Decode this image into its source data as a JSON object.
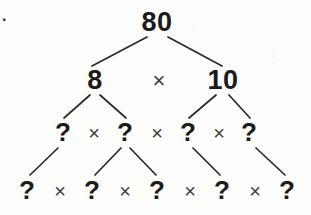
{
  "figure": {
    "kind": "factor-tree",
    "width": 311,
    "height": 215,
    "background_color": "#fdfdfc",
    "ink_color": "#1b1b1b",
    "operator_color": "#3c3c3c"
  },
  "list_marker": {
    "text": "4.",
    "note": "partially cropped at the left edge"
  },
  "rows": {
    "row1": {
      "nodes": [
        {
          "id": "n-80",
          "label": "80",
          "x": 157,
          "y": 22
        }
      ],
      "operators": []
    },
    "row2": {
      "nodes": [
        {
          "id": "n-8",
          "label": "8",
          "x": 95,
          "y": 80
        },
        {
          "id": "n-10",
          "label": "10",
          "x": 223,
          "y": 80
        }
      ],
      "operators": [
        {
          "id": "op-r2-1",
          "label": "×",
          "x": 159,
          "y": 81
        }
      ]
    },
    "row3": {
      "nodes": [
        {
          "id": "n-r3-1",
          "label": "?",
          "x": 63,
          "y": 132
        },
        {
          "id": "n-r3-2",
          "label": "?",
          "x": 125,
          "y": 132
        },
        {
          "id": "n-r3-3",
          "label": "?",
          "x": 188,
          "y": 132
        },
        {
          "id": "n-r3-4",
          "label": "?",
          "x": 249,
          "y": 132
        }
      ],
      "operators": [
        {
          "id": "op-r3-1",
          "label": "×",
          "x": 94,
          "y": 133
        },
        {
          "id": "op-r3-2",
          "label": "×",
          "x": 157,
          "y": 133
        },
        {
          "id": "op-r3-3",
          "label": "×",
          "x": 219,
          "y": 133
        }
      ]
    },
    "row4": {
      "nodes": [
        {
          "id": "n-r4-1",
          "label": "?",
          "x": 27,
          "y": 190
        },
        {
          "id": "n-r4-2",
          "label": "?",
          "x": 92,
          "y": 190
        },
        {
          "id": "n-r4-3",
          "label": "?",
          "x": 157,
          "y": 190
        },
        {
          "id": "n-r4-4",
          "label": "?",
          "x": 222,
          "y": 190
        },
        {
          "id": "n-r4-5",
          "label": "?",
          "x": 287,
          "y": 190
        }
      ],
      "operators": [
        {
          "id": "op-r4-1",
          "label": "×",
          "x": 60,
          "y": 191
        },
        {
          "id": "op-r4-2",
          "label": "×",
          "x": 125,
          "y": 191
        },
        {
          "id": "op-r4-3",
          "label": "×",
          "x": 190,
          "y": 191
        },
        {
          "id": "op-r4-4",
          "label": "×",
          "x": 255,
          "y": 191
        }
      ]
    }
  },
  "edges": [
    {
      "id": "edge-80-8",
      "from": "n-80",
      "to": "n-8",
      "x1": 147,
      "y1": 37,
      "x2": 92,
      "y2": 66
    },
    {
      "id": "edge-80-10",
      "from": "n-80",
      "to": "n-10",
      "x1": 168,
      "y1": 37,
      "x2": 222,
      "y2": 66
    },
    {
      "id": "edge-8-r3-1",
      "from": "n-8",
      "to": "n-r3-1",
      "x1": 90,
      "y1": 95,
      "x2": 64,
      "y2": 118
    },
    {
      "id": "edge-8-r3-2",
      "from": "n-8",
      "to": "n-r3-2",
      "x1": 100,
      "y1": 95,
      "x2": 126,
      "y2": 118
    },
    {
      "id": "edge-10-r3-3",
      "from": "n-10",
      "to": "n-r3-3",
      "x1": 216,
      "y1": 95,
      "x2": 189,
      "y2": 118
    },
    {
      "id": "edge-10-r3-4",
      "from": "n-10",
      "to": "n-r3-4",
      "x1": 229,
      "y1": 95,
      "x2": 250,
      "y2": 118
    },
    {
      "id": "edge-r3-1-r4-1",
      "from": "n-r3-1",
      "to": "n-r4-1",
      "x1": 58,
      "y1": 148,
      "x2": 30,
      "y2": 175
    },
    {
      "id": "edge-r3-2-r4-2",
      "from": "n-r3-2",
      "to": "n-r4-2",
      "x1": 121,
      "y1": 148,
      "x2": 95,
      "y2": 175
    },
    {
      "id": "edge-r3-2-r4-3",
      "from": "n-r3-2",
      "to": "n-r4-3",
      "x1": 130,
      "y1": 148,
      "x2": 156,
      "y2": 175
    },
    {
      "id": "edge-r3-3-r4-4",
      "from": "n-r3-3",
      "to": "n-r4-4",
      "x1": 193,
      "y1": 148,
      "x2": 220,
      "y2": 175
    },
    {
      "id": "edge-r3-4-r4-5",
      "from": "n-r3-4",
      "to": "n-r4-5",
      "x1": 256,
      "y1": 148,
      "x2": 285,
      "y2": 175
    }
  ]
}
